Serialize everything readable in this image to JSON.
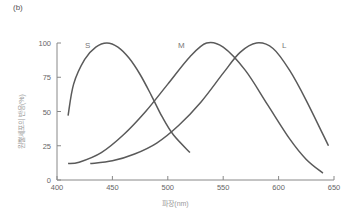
{
  "panel_label": "(b)",
  "chart_data": {
    "type": "line",
    "title": "",
    "xlabel": "파장(nm)",
    "ylabel": "원뿔세포의 반응(%)",
    "xlim": [
      400,
      650
    ],
    "ylim": [
      0,
      100
    ],
    "xticks": [
      400,
      450,
      500,
      550,
      600,
      650
    ],
    "yticks": [
      0,
      25,
      50,
      75,
      100
    ],
    "grid": false,
    "legend": "inline labels",
    "series": [
      {
        "name": "S",
        "x": [
          410,
          415,
          425,
          435,
          445,
          455,
          465,
          475,
          485,
          495,
          505,
          520
        ],
        "values": [
          47,
          70,
          88,
          97,
          100,
          97,
          89,
          77,
          62,
          46,
          33,
          20
        ]
      },
      {
        "name": "M",
        "x": [
          410,
          420,
          440,
          460,
          480,
          500,
          520,
          535,
          550,
          570,
          590,
          610,
          625,
          640
        ],
        "values": [
          12,
          13,
          20,
          33,
          50,
          70,
          90,
          100,
          97,
          80,
          55,
          30,
          15,
          5
        ]
      },
      {
        "name": "L",
        "x": [
          430,
          450,
          470,
          490,
          510,
          530,
          550,
          565,
          580,
          595,
          610,
          625,
          645
        ],
        "values": [
          12,
          14,
          19,
          27,
          40,
          57,
          78,
          93,
          100,
          96,
          80,
          58,
          25
        ]
      }
    ]
  }
}
